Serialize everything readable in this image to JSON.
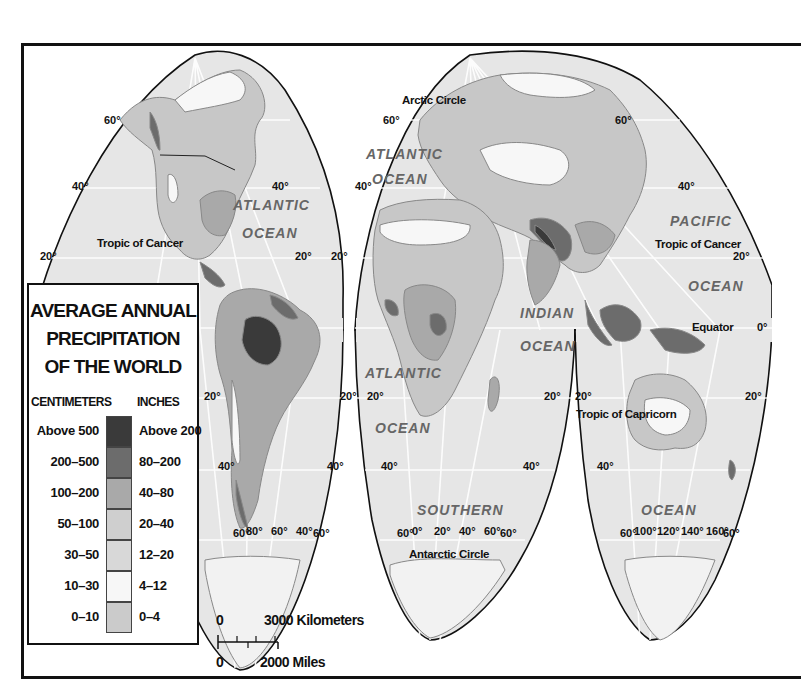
{
  "legend": {
    "title_lines": [
      "AVERAGE ANNUAL",
      "PRECIPITATION",
      "OF THE WORLD"
    ],
    "col_left": "CENTIMETERS",
    "col_right": "INCHES",
    "rows": [
      {
        "cm": "Above 500",
        "in": "Above 200",
        "color": "#3a3a3a"
      },
      {
        "cm": "200–500",
        "in": "80–200",
        "color": "#6c6c6c"
      },
      {
        "cm": "100–200",
        "in": "40–80",
        "color": "#a9a9a9"
      },
      {
        "cm": "50–100",
        "in": "20–40",
        "color": "#cfcfcf"
      },
      {
        "cm": "30–50",
        "in": "12–20",
        "color": "#d8d8d8"
      },
      {
        "cm": "10–30",
        "in": "4–12",
        "color": "#f7f7f7"
      },
      {
        "cm": "0–10",
        "in": "0–4",
        "color": "#cbcbcb"
      }
    ]
  },
  "scale": {
    "km_zero": "0",
    "km_label": "3000 Kilometers",
    "mi_zero": "0",
    "mi_label": "2000 Miles"
  },
  "map": {
    "colors": {
      "ocean": "#e6e6e6",
      "grid": "#ffffff",
      "outline": "#111111",
      "very_wet": "#3a3a3a",
      "wet": "#6c6c6c",
      "medium": "#a9a9a9",
      "moderate": "#c7c7c7",
      "dry": "#f7f7f7"
    },
    "oceans": {
      "atlantic_n1": "ATLANTIC",
      "atlantic_n2": "OCEAN",
      "atlantic_ne1": "ATLANTIC",
      "atlantic_ne2": "OCEAN",
      "atlantic_s1": "ATLANTIC",
      "atlantic_s2": "OCEAN",
      "pacific1": "PACIFIC",
      "pacific2": "OCEAN",
      "indian1": "INDIAN",
      "indian2": "OCEAN",
      "southern": "SOUTHERN",
      "ocean_se": "OCEAN"
    },
    "lines": {
      "tropic_cancer_w": "Tropic of Cancer",
      "tropic_cancer_e": "Tropic of Cancer",
      "tropic_capricorn": "Tropic of Capricorn",
      "arctic_circle": "Arctic Circle",
      "antarctic_circle": "Antarctic Circle",
      "equator": "Equator"
    },
    "degrees": {
      "d60": "60°",
      "d40": "40°",
      "d20": "20°",
      "d0": "0°",
      "d80": "80°",
      "d100": "100°",
      "d120": "120°",
      "d140": "140°",
      "d160": "160°"
    }
  }
}
